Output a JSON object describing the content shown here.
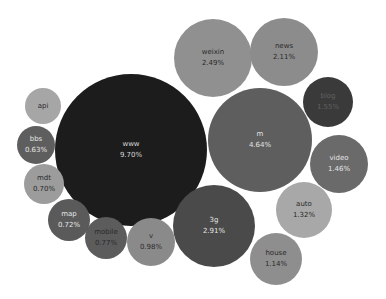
{
  "chart_data": {
    "type": "bubble",
    "title": "",
    "legend": "none",
    "grid": false,
    "unit": "%",
    "items": [
      {
        "label": "www",
        "value": 9.7,
        "display": "9.70%",
        "cx": 131,
        "cy": 150,
        "r": 76,
        "color": "#1c1c1c",
        "text": "#d8d8d8"
      },
      {
        "label": "m",
        "value": 4.64,
        "display": "4.64%",
        "cx": 260,
        "cy": 140,
        "r": 52,
        "color": "#5e5e5e",
        "text": "#e4e4e4"
      },
      {
        "label": "3g",
        "value": 2.91,
        "display": "2.91%",
        "cx": 214,
        "cy": 226,
        "r": 41,
        "color": "#4a4a4a",
        "text": "#e4e4e4"
      },
      {
        "label": "weixin",
        "value": 2.49,
        "display": "2.49%",
        "cx": 213,
        "cy": 58,
        "r": 39,
        "color": "#909090",
        "text": "#2a2a2a"
      },
      {
        "label": "news",
        "value": 2.11,
        "display": "2.11%",
        "cx": 284,
        "cy": 52,
        "r": 34,
        "color": "#8c8c8c",
        "text": "#2a2a2a"
      },
      {
        "label": "blog",
        "value": 1.55,
        "display": "1.55%",
        "cx": 328,
        "cy": 102,
        "r": 25,
        "color": "#3a3a3a",
        "text": "#606060"
      },
      {
        "label": "video",
        "value": 1.46,
        "display": "1.46%",
        "cx": 339,
        "cy": 164,
        "r": 29,
        "color": "#6a6a6a",
        "text": "#e6e6e6"
      },
      {
        "label": "auto",
        "value": 1.32,
        "display": "1.32%",
        "cx": 304,
        "cy": 210,
        "r": 28,
        "color": "#a8a8a8",
        "text": "#2a2a2a"
      },
      {
        "label": "house",
        "value": 1.14,
        "display": "1.14%",
        "cx": 276,
        "cy": 259,
        "r": 26,
        "color": "#8e8e8e",
        "text": "#2a2a2a"
      },
      {
        "label": "v",
        "value": 0.98,
        "display": "0.98%",
        "cx": 151,
        "cy": 242,
        "r": 24,
        "color": "#8a8a8a",
        "text": "#2a2a2a"
      },
      {
        "label": "mobile",
        "value": 0.77,
        "display": "0.77%",
        "cx": 106,
        "cy": 238,
        "r": 21,
        "color": "#5c5c5c",
        "text": "#2a2a2a"
      },
      {
        "label": "map",
        "value": 0.72,
        "display": "0.72%",
        "cx": 69,
        "cy": 220,
        "r": 21,
        "color": "#5a5a5a",
        "text": "#e6e6e6"
      },
      {
        "label": "mdt",
        "value": 0.7,
        "display": "0.70%",
        "cx": 44,
        "cy": 184,
        "r": 20,
        "color": "#9c9c9c",
        "text": "#2a2a2a"
      },
      {
        "label": "bbs",
        "value": 0.63,
        "display": "0.63%",
        "cx": 36,
        "cy": 145,
        "r": 19,
        "color": "#5e5e5e",
        "text": "#e6e6e6"
      },
      {
        "label": "api",
        "value": null,
        "display": "",
        "cx": 43,
        "cy": 106,
        "r": 18,
        "color": "#a6a6a6",
        "text": "#2a2a2a"
      }
    ]
  }
}
